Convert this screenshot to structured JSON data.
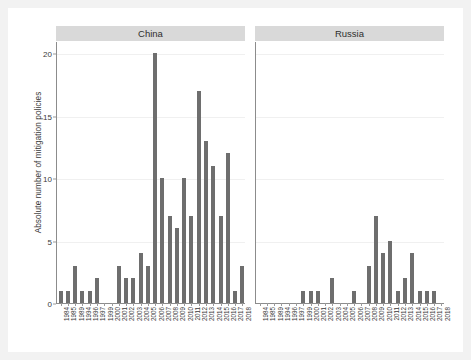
{
  "chart_data": {
    "type": "bar",
    "title": "",
    "xlabel": "",
    "ylabel": "Absolute number of mitigation policies",
    "ylim": [
      0,
      21
    ],
    "yticks": [
      0,
      5,
      10,
      15,
      20
    ],
    "grid": true,
    "legend": "none",
    "bar_color": "#6e6e6e",
    "panel_strip_color": "#d9d9d9",
    "background_color": "#f2f2f2",
    "plot_background_color": "#ffffff",
    "categories": [
      "1984",
      "1985",
      "1989",
      "1994",
      "1996",
      "1997",
      "1999",
      "2000",
      "2001",
      "2002",
      "2003",
      "2004",
      "2005",
      "2006",
      "2007",
      "2008",
      "2009",
      "2010",
      "2011",
      "2012",
      "2013",
      "2014",
      "2015",
      "2016",
      "2017",
      "2018"
    ],
    "panels": [
      {
        "label": "China",
        "values": [
          1,
          1,
          3,
          1,
          1,
          2,
          0,
          0,
          3,
          2,
          2,
          4,
          3,
          20,
          10,
          7,
          6,
          10,
          7,
          17,
          13,
          11,
          7,
          12,
          1,
          3
        ]
      },
      {
        "label": "Russia",
        "values": [
          0,
          0,
          0,
          0,
          0,
          0,
          1,
          1,
          1,
          0,
          2,
          0,
          0,
          1,
          0,
          3,
          7,
          4,
          5,
          1,
          2,
          4,
          1,
          1,
          1,
          0
        ]
      }
    ]
  }
}
